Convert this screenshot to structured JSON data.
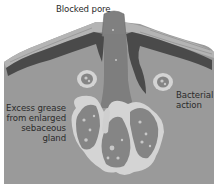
{
  "diagram": {
    "labels": {
      "blocked_pore": "Blocked pore",
      "bacterial_action": [
        "Bacterial",
        "action"
      ],
      "excess_grease": [
        "Excess grease",
        "from enlarged",
        "sebaceous",
        "gland"
      ]
    },
    "colors": {
      "background": "#ffffff",
      "dermis": "#9a9a9a",
      "epidermis_light": "#b4b4b4",
      "pigment_layer": "#4a4a4a",
      "pore_plug": "#7e7e7e",
      "gland_outline": "#d4d4d4",
      "gland_interior": "#858585",
      "sebum_globule": "#c8c8c8",
      "text": "#2b2b2b"
    }
  }
}
